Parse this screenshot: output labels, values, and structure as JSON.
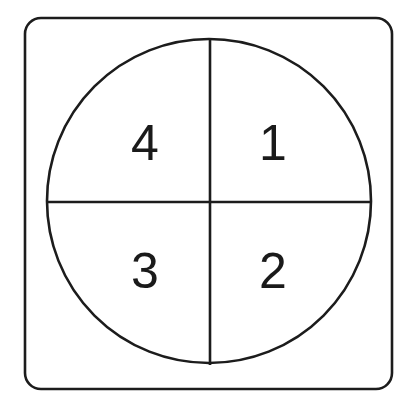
{
  "figure": {
    "background_color": "#ffffff",
    "stroke_color": "#1c1c1c",
    "text_color": "#1a1a1a"
  },
  "frame": {
    "name": "rounded-square-frame",
    "x": 25,
    "y": 18,
    "width": 367,
    "height": 371,
    "corner_radius": 16,
    "stroke_width": 2.6
  },
  "circle": {
    "name": "outer-circle",
    "center_x": 209,
    "center_y": 201,
    "radius": 162,
    "stroke_width": 2.6
  },
  "dividers": {
    "vertical": {
      "x": 210,
      "y1": 38,
      "y2": 365
    },
    "horizontal": {
      "y": 202,
      "x1": 47,
      "x2": 371
    }
  },
  "quadrants": [
    {
      "id": "quadrant-1",
      "label": "1",
      "position": "top-right",
      "x": 273,
      "y": 160
    },
    {
      "id": "quadrant-2",
      "label": "2",
      "position": "bottom-right",
      "x": 273,
      "y": 288
    },
    {
      "id": "quadrant-3",
      "label": "3",
      "position": "bottom-left",
      "x": 145,
      "y": 288
    },
    {
      "id": "quadrant-4",
      "label": "4",
      "position": "top-left",
      "x": 145,
      "y": 160
    }
  ]
}
